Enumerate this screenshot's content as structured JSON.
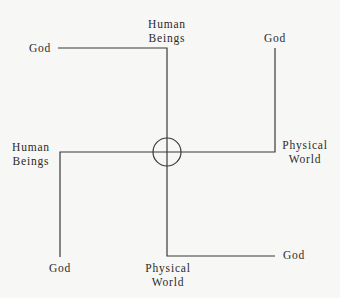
{
  "diagram": {
    "type": "swastika-like quadrant diagram with central circled cross",
    "colors": {
      "line": "#3a3a3a",
      "text": "#2a2a2a",
      "background": "#f7f7f5"
    },
    "labels": {
      "top_left_god": "God",
      "top_human_line1": "Human",
      "top_human_line2": "Beings",
      "top_right_god": "God",
      "left_human_line1": "Human",
      "left_human_line2": "Beings",
      "right_physical_line1": "Physical",
      "right_physical_line2": "World",
      "bottom_left_god": "God",
      "bottom_physical_line1": "Physical",
      "bottom_physical_line2": "World",
      "bottom_right_god": "God"
    }
  }
}
